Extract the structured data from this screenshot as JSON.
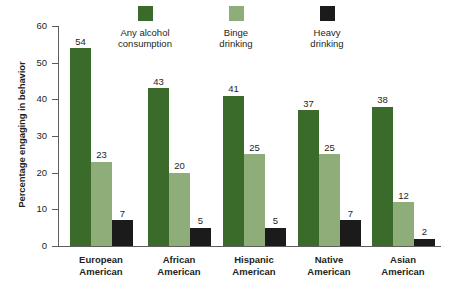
{
  "chart_data": {
    "type": "bar",
    "title": "",
    "xlabel": "",
    "ylabel": "Percentage engaging in behavior",
    "ylim": [
      0,
      60
    ],
    "yticks": [
      "0",
      "10",
      "20",
      "30",
      "40",
      "50",
      "60"
    ],
    "grid": false,
    "legend_position": "top",
    "categories": [
      "European\nAmerican",
      "African\nAmerican",
      "Hispanic\nAmerican",
      "Native\nAmerican",
      "Asian\nAmerican"
    ],
    "series": [
      {
        "name": "Any alcohol\nconsumption",
        "color": "#3b6b2a",
        "values": [
          54,
          43,
          41,
          37,
          38
        ]
      },
      {
        "name": "Binge\ndrinking",
        "color": "#8fad78",
        "values": [
          23,
          20,
          25,
          25,
          12
        ]
      },
      {
        "name": "Heavy\ndrinking",
        "color": "#1b1b1b",
        "values": [
          7,
          5,
          5,
          7,
          2
        ]
      }
    ]
  },
  "legend": {
    "items": [
      {
        "label": "Any alcohol\nconsumption",
        "color": "#3b6b2a"
      },
      {
        "label": "Binge\ndrinking",
        "color": "#8fad78"
      },
      {
        "label": "Heavy\ndrinking",
        "color": "#1b1b1b"
      }
    ]
  },
  "axis": {
    "y_title": "Percentage engaging in behavior"
  }
}
